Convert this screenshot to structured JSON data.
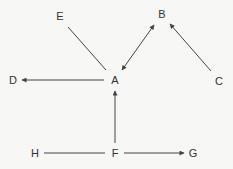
{
  "diagram": {
    "type": "directed-graph",
    "nodes": [
      {
        "id": "A",
        "label": "A",
        "x": 115,
        "y": 80
      },
      {
        "id": "B",
        "label": "B",
        "x": 162,
        "y": 14
      },
      {
        "id": "C",
        "label": "C",
        "x": 219,
        "y": 81
      },
      {
        "id": "D",
        "label": "D",
        "x": 13,
        "y": 80
      },
      {
        "id": "E",
        "label": "E",
        "x": 60,
        "y": 16
      },
      {
        "id": "F",
        "label": "F",
        "x": 115,
        "y": 153
      },
      {
        "id": "G",
        "label": "G",
        "x": 193,
        "y": 153
      },
      {
        "id": "H",
        "label": "H",
        "x": 35,
        "y": 153
      }
    ],
    "edges": [
      {
        "from": "E",
        "to": "A",
        "x1": 68,
        "y1": 27,
        "x2": 106,
        "y2": 70,
        "arrow_start": false,
        "arrow_end": false
      },
      {
        "from": "A",
        "to": "B",
        "x1": 122,
        "y1": 70,
        "x2": 154,
        "y2": 25,
        "arrow_start": true,
        "arrow_end": true
      },
      {
        "from": "C",
        "to": "B",
        "x1": 211,
        "y1": 71,
        "x2": 170,
        "y2": 24,
        "arrow_start": false,
        "arrow_end": true
      },
      {
        "from": "A",
        "to": "D",
        "x1": 104,
        "y1": 80,
        "x2": 22,
        "y2": 80,
        "arrow_start": false,
        "arrow_end": true
      },
      {
        "from": "F",
        "to": "A",
        "x1": 115,
        "y1": 143,
        "x2": 115,
        "y2": 91,
        "arrow_start": false,
        "arrow_end": true
      },
      {
        "from": "H",
        "to": "F",
        "x1": 44,
        "y1": 153,
        "x2": 105,
        "y2": 153,
        "arrow_start": false,
        "arrow_end": false
      },
      {
        "from": "F",
        "to": "G",
        "x1": 124,
        "y1": 153,
        "x2": 184,
        "y2": 153,
        "arrow_start": false,
        "arrow_end": true
      }
    ],
    "colors": {
      "background": "#f7f7f5",
      "line": "#444444",
      "text": "#333333"
    }
  }
}
